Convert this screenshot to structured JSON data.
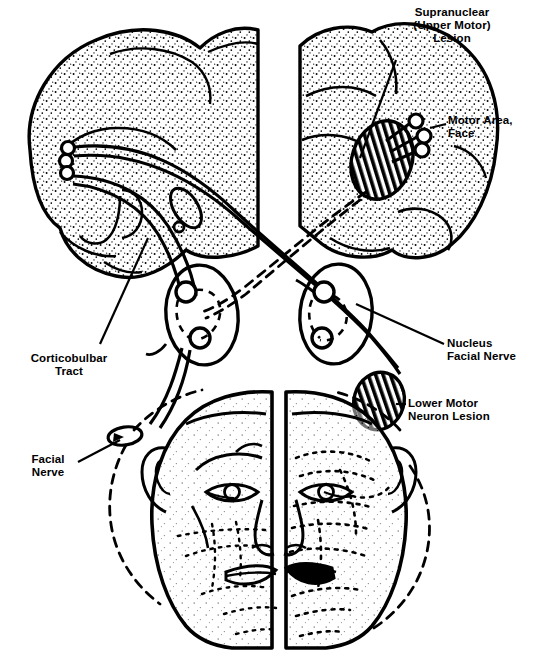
{
  "figure": {
    "background_color": "#ffffff",
    "ink_color": "#000000"
  },
  "labels": {
    "supranuclear": {
      "line1": "Supranuclear",
      "line2": "(Upper Motor)",
      "line3": "Lesion"
    },
    "motor_area": {
      "line1": "Motor Area,",
      "line2": "Face"
    },
    "nucleus_facial_nerve": {
      "line1": "Nucleus",
      "line2": "Facial Nerve"
    },
    "lower_motor_neuron": {
      "line1": "Lower Motor",
      "line2": "Neuron  Lesion"
    },
    "corticobulbar_tract": {
      "line1": "Corticobulbar",
      "line2": "Tract"
    },
    "facial_nerve": {
      "line1": "Facial",
      "line2": "Nerve"
    }
  },
  "structures": {
    "left_hemisphere": "cerebral-hemisphere-left",
    "right_hemisphere": "cerebral-hemisphere-right",
    "supranuclear_lesion": "hatched-ellipse-lesion",
    "lower_motor_neuron_lesion": "hatched-ellipse-lesion",
    "left_facial_nucleus": "brainstem-nucleus-oval",
    "right_facial_nucleus": "brainstem-nucleus-oval",
    "left_face": "hemiface-left",
    "right_face": "hemiface-right",
    "facial_nerve_marker": "small-oval-nerve"
  },
  "colors": {
    "ink": "#000000",
    "paper": "#ffffff"
  }
}
